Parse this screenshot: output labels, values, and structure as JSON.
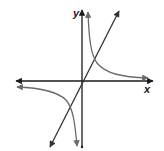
{
  "diagram": {
    "type": "coordinate-graph",
    "axes": {
      "x_label": "x",
      "y_label": "y",
      "origin_px": [
        82,
        81
      ]
    },
    "colors": {
      "axes": "#1a1a1a",
      "line": "#333333",
      "hyperbola": "#6a6a6a",
      "background": "#ffffff"
    },
    "elements": [
      {
        "name": "x-axis",
        "kind": "axis",
        "arrows": "both"
      },
      {
        "name": "y-axis",
        "kind": "axis",
        "arrows": "top"
      },
      {
        "name": "line-through-origin",
        "kind": "line",
        "arrows": "both"
      },
      {
        "name": "hyperbola-branch-q1",
        "kind": "curve",
        "arrows": "both"
      },
      {
        "name": "hyperbola-branch-q3",
        "kind": "curve",
        "arrows": "both"
      }
    ]
  }
}
